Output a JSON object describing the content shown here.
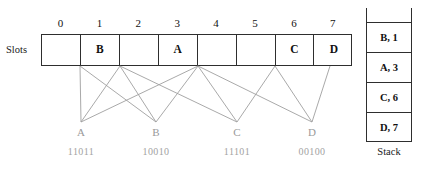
{
  "figure": {
    "clipped_top_text": "",
    "slots_label": "Slots",
    "stack_caption": "Stack"
  },
  "slots": {
    "indices": [
      "0",
      "1",
      "2",
      "3",
      "4",
      "5",
      "6",
      "7"
    ],
    "values": [
      "",
      "B",
      "",
      "A",
      "",
      "",
      "C",
      "D"
    ]
  },
  "keys": [
    {
      "name": "A",
      "bits": "11011"
    },
    {
      "name": "B",
      "bits": "10010"
    },
    {
      "name": "C",
      "bits": "11101"
    },
    {
      "name": "D",
      "bits": "00100"
    }
  ],
  "stack": {
    "entries": [
      "B, 1",
      "A, 3",
      "C, 6",
      "D, 7"
    ]
  },
  "links": [
    {
      "key": "A",
      "slot_x": 80,
      "fan_x": 81
    },
    {
      "key": "A",
      "slot_x": 120,
      "fan_x": 81
    },
    {
      "key": "A",
      "slot_x": 198,
      "fan_x": 81
    },
    {
      "key": "B",
      "slot_x": 80,
      "fan_x": 156
    },
    {
      "key": "B",
      "slot_x": 120,
      "fan_x": 156
    },
    {
      "key": "B",
      "slot_x": 198,
      "fan_x": 156
    },
    {
      "key": "C",
      "slot_x": 120,
      "fan_x": 237
    },
    {
      "key": "C",
      "slot_x": 198,
      "fan_x": 237
    },
    {
      "key": "C",
      "slot_x": 275,
      "fan_x": 237
    },
    {
      "key": "D",
      "slot_x": 198,
      "fan_x": 312
    },
    {
      "key": "D",
      "slot_x": 275,
      "fan_x": 312
    },
    {
      "key": "D",
      "slot_x": 330,
      "fan_x": 312
    }
  ],
  "colors": {
    "ink": "#2e2e2e",
    "link_line": "#9f9f9f",
    "key_text": "#9a9a9a",
    "bits_text": "#a2a2a2",
    "paper": "#ffffff"
  },
  "geometry": {
    "table_left": 41,
    "table_top": 34,
    "table_width": 311,
    "table_height": 32,
    "slot_width": 38.9,
    "fan_y": 122,
    "key_label_y": 126,
    "key_bits_y": 146,
    "key_x": [
      59,
      134,
      215,
      290
    ]
  }
}
